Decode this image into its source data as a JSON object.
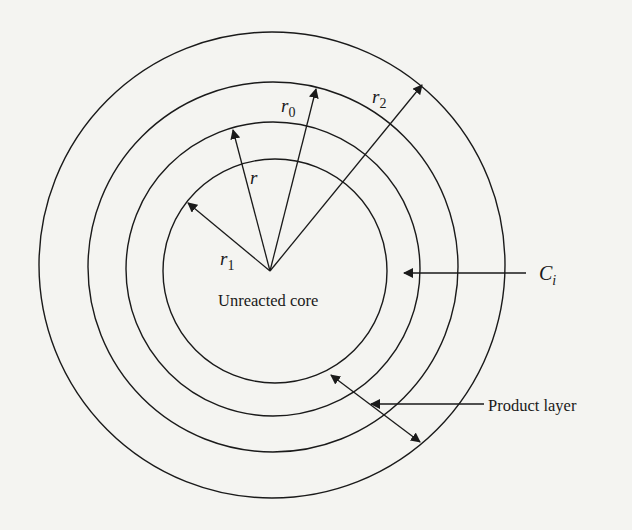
{
  "diagram": {
    "type": "shrinking-core-model",
    "colors": {
      "background": "#f4f4f1",
      "stroke": "#1a1a1a"
    },
    "circles": [
      {
        "name": "outer-particle-surface",
        "cx": 272,
        "cy": 265,
        "r": 233
      },
      {
        "name": "shell-r2",
        "cx": 273,
        "cy": 267,
        "r": 185
      },
      {
        "name": "shell-r0",
        "cx": 273,
        "cy": 269,
        "r": 147
      },
      {
        "name": "unreacted-core-r1",
        "cx": 275,
        "cy": 271,
        "r": 112
      }
    ],
    "center": {
      "x": 270,
      "y": 271
    },
    "radius_arrows": [
      {
        "label": "r",
        "sub": "1",
        "tip": [
          188,
          203
        ],
        "label_pos": [
          220,
          265
        ]
      },
      {
        "label": "r",
        "sub": "",
        "tip": [
          233,
          130
        ],
        "label_pos": [
          250,
          184
        ]
      },
      {
        "label": "r",
        "sub": "0",
        "tip": [
          316,
          89
        ],
        "label_pos": [
          281,
          112
        ]
      },
      {
        "label": "r",
        "sub": "2",
        "tip": [
          422,
          85
        ],
        "label_pos": [
          372,
          103
        ]
      }
    ],
    "labels": {
      "core": "Unreacted core",
      "ci_main": "C",
      "ci_sub": "i",
      "product_layer": "Product layer"
    }
  }
}
